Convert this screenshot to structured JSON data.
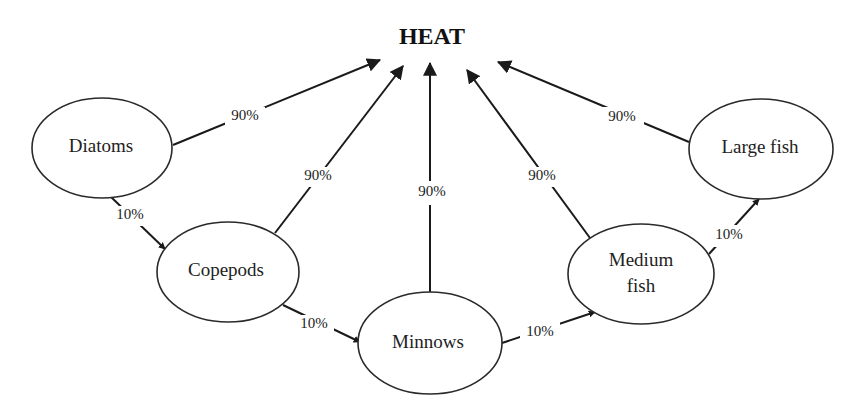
{
  "title": "HEAT",
  "nodes": {
    "diatoms": {
      "label": "Diatoms"
    },
    "copepods": {
      "label": "Copepods"
    },
    "minnows": {
      "label": "Minnows"
    },
    "medium_fish": {
      "line1": "Medium",
      "line2": "fish"
    },
    "large_fish": {
      "label": "Large fish"
    }
  },
  "edges": {
    "diatoms_heat": "90%",
    "copepods_heat": "90%",
    "minnows_heat": "90%",
    "medium_fish_heat": "90%",
    "large_fish_heat": "90%",
    "diatoms_copepods": "10%",
    "copepods_minnows": "10%",
    "minnows_medium_fish": "10%",
    "medium_fish_large_fish": "10%"
  },
  "colors": {
    "stroke": "#1a1a1a",
    "background": "#ffffff"
  }
}
